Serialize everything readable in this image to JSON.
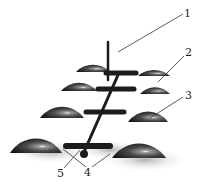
{
  "diagram": {
    "type": "technical-illustration",
    "background": "#ffffff",
    "colors": {
      "dome_dark": "#1a1a1a",
      "dome_mid": "#555555",
      "dome_highlight": "#f2f2f2",
      "rod": "#1c1c1c",
      "shadow": "#bdbdbd",
      "leader_line": "#333333",
      "label_text": "#222222"
    },
    "callouts": [
      {
        "id": "1",
        "label": "1",
        "x": 184,
        "y": 8
      },
      {
        "id": "2",
        "label": "2",
        "x": 185,
        "y": 47
      },
      {
        "id": "3",
        "label": "3",
        "x": 185,
        "y": 90
      },
      {
        "id": "4",
        "label": "4",
        "x": 84,
        "y": 167
      },
      {
        "id": "5",
        "label": "5",
        "x": 57,
        "y": 168
      }
    ],
    "components": [
      {
        "ref": "1",
        "name": "vertical-rod"
      },
      {
        "ref": "2",
        "name": "dome-element-upper-right"
      },
      {
        "ref": "3",
        "name": "dome-element-middle-right"
      },
      {
        "ref": "4",
        "name": "crossbar-ends"
      },
      {
        "ref": "5",
        "name": "rod-base"
      }
    ]
  }
}
